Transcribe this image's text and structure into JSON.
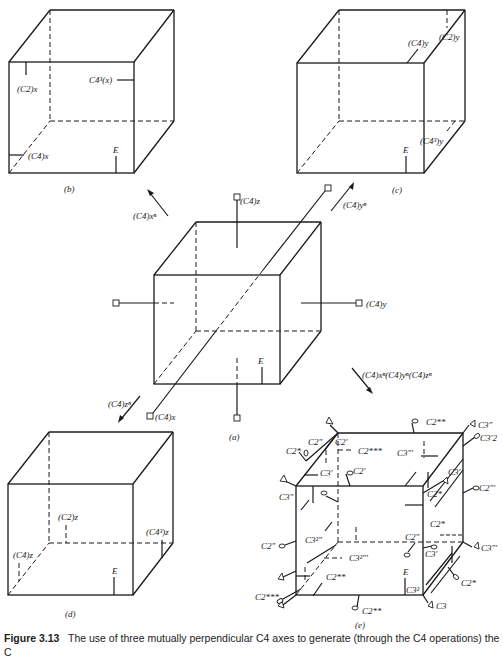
{
  "figure": {
    "number": "Figure 3.13",
    "caption": "The use of three mutually perpendicular C4 axes to generate (through the C4 operations) the",
    "caption_continuation": "C"
  },
  "panels": {
    "a": {
      "label": "(a)",
      "axes": [
        "(C4)x",
        "(C4)y",
        "(C4)z"
      ],
      "identity": "E"
    },
    "b": {
      "label": "(b)",
      "marks": [
        "(C2)x",
        "C4^3(x)",
        "(C4)x",
        "E"
      ]
    },
    "c": {
      "label": "(c)",
      "marks": [
        "(C4)y",
        "(C2)y",
        "(C4^3)y",
        "E"
      ]
    },
    "d": {
      "label": "(d)",
      "marks": [
        "(C2)z",
        "(C4^3)z",
        "(C4)z",
        "E"
      ]
    },
    "e": {
      "label": "(e)",
      "marks": [
        "C2**",
        "C2'",
        "C2***",
        "C2\"",
        "C2*",
        "C3'",
        "C3\"",
        "C3'2",
        "C2\"'",
        "C3\"'",
        "C3^2\"",
        "C3^2\"'",
        "C3",
        "C3^2",
        "E"
      ]
    }
  },
  "arrows": {
    "to_b": "(C4)x^n",
    "to_c": "(C4)y^n",
    "to_d": "(C4)z^n",
    "to_e": "(C4)x^n(C4)y^n(C4)z^n"
  },
  "labels": {
    "a_x": "(C4)x",
    "a_y": "(C4)y",
    "a_z": "(C4)z",
    "E": "E",
    "b_c2x": "(C2)x",
    "b_c43x": "C4³(x)",
    "b_c4x": "(C4)x",
    "c_c4y": "(C4)y",
    "c_c2y": "(C2)y",
    "c_c43y": "(C4³)y",
    "d_c2z": "(C2)z",
    "d_c43z": "(C4³)z",
    "d_c4z": "(C4)z",
    "arrow_b": "(C4)xⁿ",
    "arrow_c": "(C4)yⁿ",
    "arrow_d": "(C4)zⁿ",
    "arrow_e": "(C4)xⁿ(C4)yⁿ(C4)zⁿ",
    "e_c2ss_top": "C2**",
    "e_c3pp_tr": "C3\"",
    "e_c3p2": "C3'2",
    "e_c2s_l": "C2*",
    "e_c2pp_l": "C2\"",
    "e_c2p_t": "C2'",
    "e_c2sss_t": "C2***",
    "e_c3ppp": "C3\"'",
    "e_c3p_l": "C3'",
    "e_c2p_m": "C2'",
    "e_c3p_r": "C3'",
    "e_c3pp_l": "C3\"",
    "e_c2s_r1": "C2*",
    "e_c2ppp_r": "C2\"'",
    "e_c2s_r2": "C2*",
    "e_c2pp_ll": "C2\"",
    "e_c32pp": "C3²\"",
    "e_c2pp_m": "C2\"",
    "e_c3p_m": "C3'",
    "e_c3ppp_r": "C3\"'",
    "e_c32ppp": "C3²\"'",
    "e_c2ss_m": "C2**",
    "e_c2s_r3": "C2*",
    "e_c2sss_b": "C2***",
    "e_c32": "C3²",
    "e_c3": "C3",
    "e_c2ss_b": "C2**",
    "panel_a": "(a)",
    "panel_b": "(b)",
    "panel_c": "(c)",
    "panel_d": "(d)",
    "panel_e": "(e)"
  }
}
